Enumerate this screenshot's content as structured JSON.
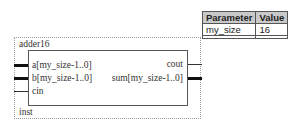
{
  "symbol": {
    "name": "adder16",
    "instance": "inst",
    "inputs": [
      {
        "label": "a[my_size-1..0]",
        "bus": true
      },
      {
        "label": "b[my_size-1..0]",
        "bus": true
      },
      {
        "label": "cin",
        "bus": false
      }
    ],
    "outputs": [
      {
        "label": "cout",
        "bus": false
      },
      {
        "label": "sum[my_size-1..0]",
        "bus": true
      }
    ]
  },
  "parameters": {
    "headers": [
      "Parameter",
      "Value"
    ],
    "rows": [
      {
        "name": "my_size",
        "value": "16"
      }
    ]
  }
}
